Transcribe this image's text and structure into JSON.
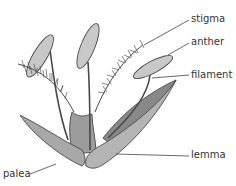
{
  "diagram": {
    "labels": {
      "stigma": "stigma",
      "anther": "anther",
      "filament": "filament",
      "lemma": "lemma",
      "palea": "palea"
    },
    "colors": {
      "outline": "#4a4a4a",
      "fill_light": "#c8c8c8",
      "fill_mid": "#9c9c9c",
      "fill_dark": "#888888",
      "text": "#333333"
    }
  }
}
